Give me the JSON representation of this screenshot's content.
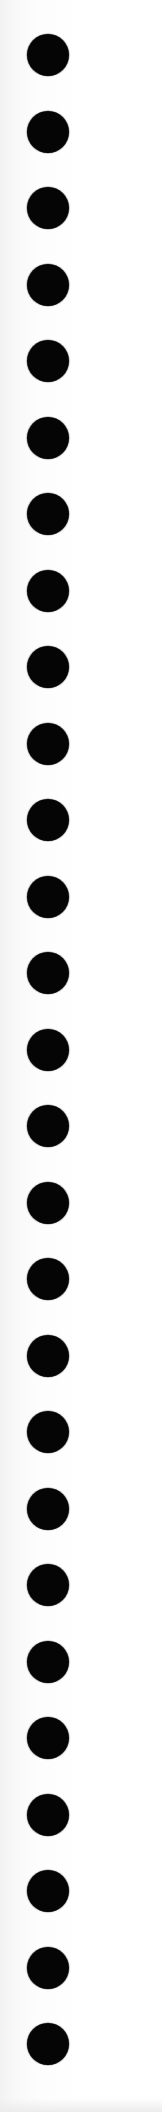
{
  "page": {
    "background_color": "#fdfdfd",
    "width": 162,
    "height": 2112
  },
  "holes": {
    "count": 27,
    "color": "#050505",
    "diameter": 42,
    "center_x": 48,
    "first_center_y": 55,
    "spacing_y": 76.5
  }
}
